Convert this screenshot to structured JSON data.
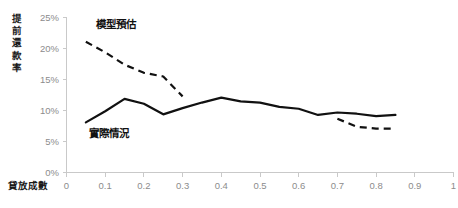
{
  "chart_data": {
    "type": "line",
    "title": "",
    "subtitle": "",
    "xlabel": "貸放成數",
    "ylabel": "提前還款率",
    "xlim": [
      0,
      1
    ],
    "ylim": [
      0,
      25
    ],
    "grid": false,
    "legend_position": "inline-annotations",
    "x_ticks": [
      "0",
      "0.1",
      "0.2",
      "0.3",
      "0.4",
      "0.5",
      "0.6",
      "0.7",
      "0.8",
      "0.9",
      "1"
    ],
    "x_tick_values": [
      0,
      0.1,
      0.2,
      0.3,
      0.4,
      0.5,
      0.6,
      0.7,
      0.8,
      0.9,
      1
    ],
    "y_ticks": [
      "0%",
      "5%",
      "10%",
      "15%",
      "20%",
      "25%"
    ],
    "y_tick_values": [
      0,
      5,
      10,
      15,
      20,
      25
    ],
    "series": [
      {
        "name": "模型預估",
        "style": "dashed",
        "color": "#111111",
        "annotation": "模型預估",
        "annotation_x": 0.075,
        "annotation_y": 23.2,
        "segments": [
          {
            "x": [
              0.05,
              0.1,
              0.15,
              0.2,
              0.25,
              0.3
            ],
            "y": [
              21.0,
              19.3,
              17.3,
              16.0,
              15.4,
              12.2
            ]
          },
          {
            "x": [
              0.7,
              0.75,
              0.8,
              0.85
            ],
            "y": [
              8.6,
              7.3,
              7.0,
              7.0
            ]
          }
        ]
      },
      {
        "name": "實際情況",
        "style": "solid",
        "color": "#111111",
        "annotation": "實際情況",
        "annotation_x": 0.058,
        "annotation_y": 5.6,
        "segments": [
          {
            "x": [
              0.05,
              0.1,
              0.15,
              0.2,
              0.25,
              0.3,
              0.35,
              0.4,
              0.45,
              0.5,
              0.55,
              0.6,
              0.65,
              0.7,
              0.75,
              0.8,
              0.85
            ],
            "y": [
              8.0,
              9.8,
              11.8,
              11.0,
              9.3,
              10.3,
              11.2,
              12.0,
              11.4,
              11.2,
              10.5,
              10.2,
              9.2,
              9.6,
              9.4,
              9.0,
              9.2
            ]
          }
        ]
      }
    ]
  },
  "axes": {
    "y_axis_title": "提前還款率",
    "x_axis_title": "貸放成數"
  },
  "colors": {
    "line": "#111111",
    "axis": "#c9c9c9",
    "tick_text": "#8c8c8c",
    "title_text": "#1a1a1a",
    "background": "#ffffff"
  }
}
